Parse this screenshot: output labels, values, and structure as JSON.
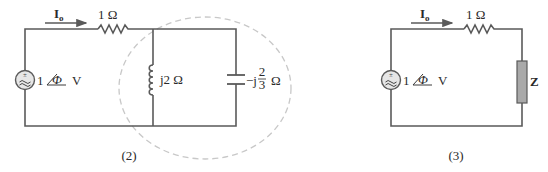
{
  "circuits": [
    {
      "id": "2",
      "caption": "(2)",
      "current_label_main": "I",
      "current_label_sub": "o",
      "resistor_label": "1 Ω",
      "source_label_mag": "1",
      "source_label_phase": "Φ",
      "source_label_unit": "V",
      "inductor_label": "j2 Ω",
      "capacitor_label_prefix": "−j",
      "capacitor_label_num": "2",
      "capacitor_label_den": "3",
      "capacitor_label_unit": "Ω"
    },
    {
      "id": "3",
      "caption": "(3)",
      "current_label_main": "I",
      "current_label_sub": "o",
      "resistor_label": "1 Ω",
      "source_label_mag": "1",
      "source_label_phase": "Φ",
      "source_label_unit": "V",
      "impedance_label": "Z"
    }
  ],
  "colors": {
    "wire": "#5a5a5a",
    "dashed_ellipse": "#c8c8c8",
    "source_fill": "#e6e6e6",
    "impedance_fill": "#a9a9a9"
  }
}
